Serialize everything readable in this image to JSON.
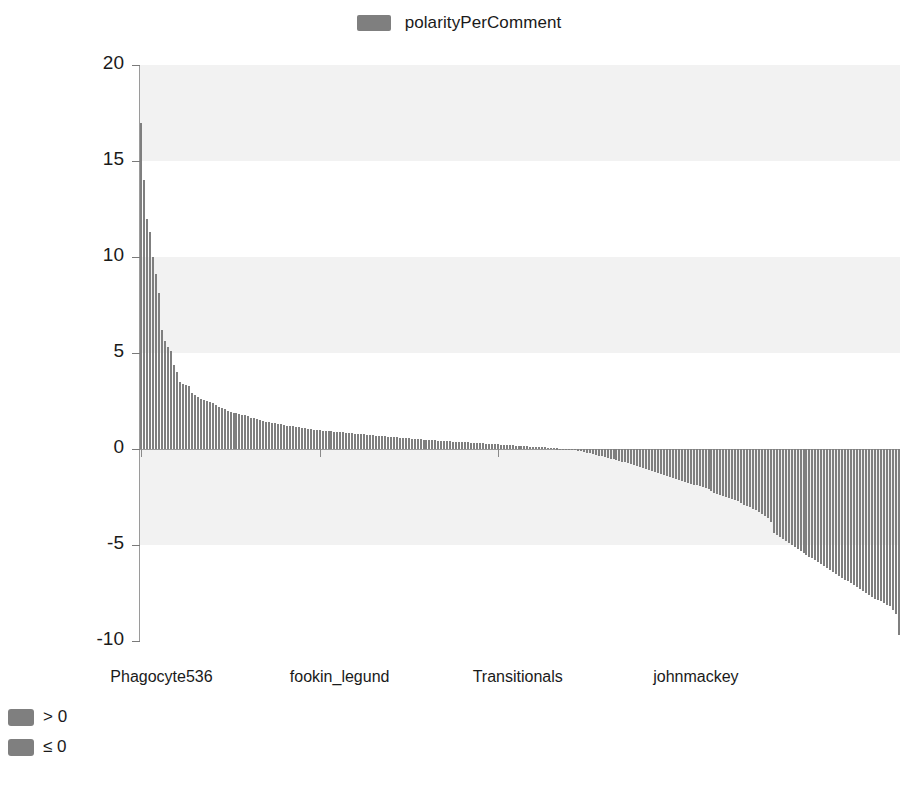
{
  "chart_data": {
    "type": "bar",
    "title": "",
    "subtitle": "",
    "xlabel": "",
    "ylabel": "",
    "ylim": [
      -10,
      20
    ],
    "yticks": [
      20,
      15,
      10,
      5,
      0,
      -5,
      -10
    ],
    "ytick_labels": [
      "20",
      "15",
      "10",
      "5",
      "0",
      "-5",
      "-10"
    ],
    "grid": "horizontal-bands",
    "legend_position": "top-center",
    "series_name": "polarityPerComment",
    "bar_color": "#7f7f7f",
    "categories": [
      "Phagocyte536",
      "",
      "",
      "",
      "",
      "",
      "",
      "",
      "",
      "",
      "",
      "",
      "",
      "",
      "",
      "",
      "",
      "",
      "",
      "",
      "",
      "",
      "",
      "",
      "",
      "",
      "",
      "",
      "",
      "",
      "",
      "",
      "",
      "",
      "",
      "",
      "",
      "",
      "",
      "",
      "",
      "",
      "",
      "",
      "",
      "",
      "",
      "",
      "",
      "",
      "",
      "",
      "",
      "",
      "",
      "",
      "",
      "",
      "",
      "",
      "fookin_legund",
      "",
      "",
      "",
      "",
      "",
      "",
      "",
      "",
      "",
      "",
      "",
      "",
      "",
      "",
      "",
      "",
      "",
      "",
      "",
      "",
      "",
      "",
      "",
      "",
      "",
      "",
      "",
      "",
      "",
      "",
      "",
      "",
      "",
      "",
      "",
      "",
      "",
      "",
      "",
      "",
      "",
      "",
      "",
      "",
      "",
      "",
      "",
      "",
      "",
      "",
      "",
      "",
      "",
      "",
      "",
      "",
      "",
      "",
      "",
      "Transitionals",
      "",
      "",
      "",
      "",
      "",
      "",
      "",
      "",
      "",
      "",
      "",
      "",
      "",
      "",
      "",
      "",
      "",
      "",
      "",
      "",
      "",
      "",
      "",
      "",
      "",
      "",
      "",
      "",
      "",
      "",
      "",
      "",
      "",
      "",
      "",
      "",
      "",
      "",
      "",
      "",
      "",
      "",
      "",
      "",
      "",
      "",
      "",
      "",
      "",
      "",
      "",
      "",
      "",
      "",
      "",
      "",
      "",
      "",
      "",
      "johnmackey",
      "",
      "",
      "",
      "",
      "",
      "",
      "",
      "",
      "",
      "",
      "",
      "",
      "",
      "",
      "",
      "",
      "",
      "",
      "",
      "",
      "",
      "",
      "",
      "",
      "",
      "",
      "",
      "",
      "",
      "",
      "",
      "",
      "",
      "",
      "",
      "",
      "",
      "",
      "",
      "",
      "",
      "",
      "",
      "",
      "",
      "",
      "",
      "",
      "",
      "",
      "",
      "",
      "",
      "",
      "",
      "",
      "",
      "",
      "",
      "",
      "",
      "",
      "",
      "",
      "",
      "",
      "",
      "",
      "",
      "",
      "",
      "",
      "",
      "",
      ""
    ],
    "xtick_positions": [
      0,
      60,
      120,
      180
    ],
    "xtick_labels": [
      "Phagocyte536",
      "fookin_legund",
      "Transitionals",
      "johnmackey"
    ],
    "values": [
      17.0,
      14.0,
      12.0,
      11.3,
      10.0,
      9.1,
      8.1,
      6.2,
      5.6,
      5.3,
      5.1,
      4.4,
      4.0,
      3.5,
      3.4,
      3.35,
      3.3,
      2.9,
      2.8,
      2.7,
      2.6,
      2.55,
      2.5,
      2.45,
      2.4,
      2.3,
      2.2,
      2.15,
      2.1,
      2.0,
      1.95,
      1.9,
      1.85,
      1.8,
      1.78,
      1.75,
      1.7,
      1.62,
      1.6,
      1.55,
      1.5,
      1.45,
      1.42,
      1.4,
      1.38,
      1.35,
      1.3,
      1.28,
      1.25,
      1.22,
      1.2,
      1.18,
      1.15,
      1.12,
      1.1,
      1.08,
      1.05,
      1.02,
      1.0,
      0.99,
      0.98,
      0.96,
      0.95,
      0.93,
      0.92,
      0.9,
      0.89,
      0.88,
      0.86,
      0.85,
      0.84,
      0.82,
      0.8,
      0.79,
      0.78,
      0.76,
      0.75,
      0.74,
      0.72,
      0.7,
      0.69,
      0.68,
      0.66,
      0.65,
      0.63,
      0.62,
      0.6,
      0.59,
      0.58,
      0.56,
      0.55,
      0.54,
      0.52,
      0.51,
      0.5,
      0.49,
      0.48,
      0.47,
      0.46,
      0.45,
      0.44,
      0.43,
      0.42,
      0.41,
      0.4,
      0.39,
      0.38,
      0.37,
      0.36,
      0.35,
      0.34,
      0.33,
      0.32,
      0.31,
      0.3,
      0.29,
      0.28,
      0.27,
      0.26,
      0.25,
      0.24,
      0.23,
      0.22,
      0.21,
      0.2,
      0.19,
      0.18,
      0.17,
      0.16,
      0.15,
      0.14,
      0.13,
      0.12,
      0.11,
      0.1,
      0.09,
      0.08,
      0.06,
      0.05,
      0.04,
      0.03,
      0.02,
      0.01,
      -0.01,
      -0.03,
      -0.05,
      -0.07,
      -0.1,
      -0.13,
      -0.16,
      -0.2,
      -0.23,
      -0.26,
      -0.3,
      -0.34,
      -0.38,
      -0.42,
      -0.46,
      -0.5,
      -0.54,
      -0.58,
      -0.62,
      -0.66,
      -0.7,
      -0.75,
      -0.8,
      -0.85,
      -0.9,
      -0.95,
      -1.0,
      -1.05,
      -1.1,
      -1.15,
      -1.2,
      -1.25,
      -1.3,
      -1.35,
      -1.4,
      -1.45,
      -1.5,
      -1.55,
      -1.6,
      -1.65,
      -1.7,
      -1.75,
      -1.8,
      -1.85,
      -1.9,
      -1.95,
      -2.0,
      -2.05,
      -2.1,
      -2.2,
      -2.3,
      -2.35,
      -2.4,
      -2.45,
      -2.5,
      -2.55,
      -2.6,
      -2.65,
      -2.7,
      -2.8,
      -2.9,
      -2.95,
      -3.0,
      -3.1,
      -3.2,
      -3.3,
      -3.4,
      -3.5,
      -3.6,
      -3.8,
      -4.4,
      -4.5,
      -4.6,
      -4.7,
      -4.8,
      -4.9,
      -5.0,
      -5.1,
      -5.2,
      -5.3,
      -5.4,
      -5.5,
      -5.6,
      -5.7,
      -5.8,
      -5.9,
      -6.0,
      -6.1,
      -6.2,
      -6.3,
      -6.4,
      -6.5,
      -6.6,
      -6.7,
      -6.8,
      -6.9,
      -7.0,
      -7.1,
      -7.2,
      -7.3,
      -7.4,
      -7.5,
      -7.6,
      -7.7,
      -7.8,
      -7.85,
      -7.9,
      -8.0,
      -8.1,
      -8.2,
      -8.4,
      -8.6,
      -9.7
    ]
  },
  "top_legend": {
    "label": "polarityPerComment",
    "swatch_color": "#7f7f7f"
  },
  "bottom_legend": {
    "items": [
      {
        "label": "> 0",
        "swatch_color": "#7f7f7f"
      },
      {
        "label": "≤ 0",
        "swatch_color": "#7f7f7f"
      }
    ]
  }
}
